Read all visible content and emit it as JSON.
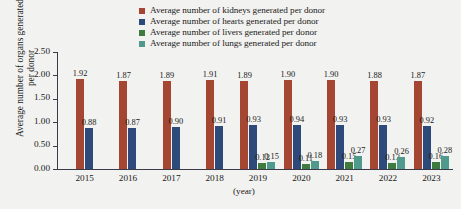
{
  "chart_data": {
    "type": "bar",
    "title": "",
    "xlabel": "(year)",
    "ylabel": "Average number of organs generated per donor",
    "categories": [
      "2015",
      "2016",
      "2017",
      "2018",
      "2019",
      "2020",
      "2021",
      "2022",
      "2023"
    ],
    "ylim": [
      0.0,
      2.5
    ],
    "ytick_labels": [
      "0.00",
      "0.50",
      "1.00",
      "1.50",
      "2.00",
      "2.50"
    ],
    "ytick_values": [
      0.0,
      0.5,
      1.0,
      1.5,
      2.0,
      2.5
    ],
    "grid": false,
    "legend_position": "top-right",
    "series": [
      {
        "name": "Average number of kidneys generated per donor",
        "key": "kidneys",
        "color": "#a54632",
        "values": [
          1.92,
          1.87,
          1.89,
          1.91,
          1.89,
          1.9,
          1.9,
          1.88,
          1.87
        ],
        "labels": [
          "1.92",
          "1.87",
          "1.89",
          "1.91",
          "1.89",
          "1.90",
          "1.90",
          "1.88",
          "1.87"
        ]
      },
      {
        "name": "Average number of hearts generated per donor",
        "key": "hearts",
        "color": "#2d4a7a",
        "values": [
          0.88,
          0.87,
          0.9,
          0.91,
          0.93,
          0.94,
          0.93,
          0.93,
          0.92
        ],
        "labels": [
          "0.88",
          "0.87",
          "0.90",
          "0.91",
          "0.93",
          "0.94",
          "0.93",
          "0.93",
          "0.92"
        ]
      },
      {
        "name": "Average number of livers generated per donor",
        "key": "livers",
        "color": "#3f7a3f",
        "values": [
          null,
          null,
          null,
          null,
          0.12,
          0.11,
          0.15,
          0.13,
          0.16
        ],
        "labels": [
          "",
          "",
          "",
          "",
          "0.12",
          "0.11",
          "0.15",
          "0.13",
          "0.16"
        ]
      },
      {
        "name": "Average number of lungs generated per donor",
        "key": "lungs",
        "color": "#4f9a8c",
        "values": [
          null,
          null,
          null,
          null,
          0.15,
          0.18,
          0.27,
          0.26,
          0.28
        ],
        "labels": [
          "",
          "",
          "",
          "",
          "0.15",
          "0.18",
          "0.27",
          "0.26",
          "0.28"
        ]
      }
    ]
  }
}
